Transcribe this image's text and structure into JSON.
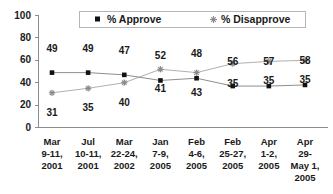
{
  "chart_data": {
    "type": "line",
    "title": "",
    "xlabel": "",
    "ylabel": "",
    "ylim": [
      0,
      100
    ],
    "yticks": [
      0,
      20,
      40,
      60,
      80,
      100
    ],
    "grid": false,
    "legend_position": "top-center",
    "categories": [
      "Mar 9-11, 2001",
      "Jul 10-11, 2001",
      "Mar 22-24, 2002",
      "Jan 7-9, 2005",
      "Feb 4-6, 2005",
      "Feb 25-27, 2005",
      "Apr 1-2, 2005",
      "Apr 29-May 1, 2005"
    ],
    "category_lines": [
      [
        "Mar",
        "9-11,",
        "2001"
      ],
      [
        "Jul",
        "10-11,",
        "2001"
      ],
      [
        "Mar",
        "22-24,",
        "2002"
      ],
      [
        "Jan",
        "7-9,",
        "2005"
      ],
      [
        "Feb",
        "4-6,",
        "2005"
      ],
      [
        "Feb",
        "25-27,",
        "2005"
      ],
      [
        "Apr",
        "1-2,",
        "2005"
      ],
      [
        "Apr",
        "29-",
        "May 1,",
        "2005"
      ]
    ],
    "series": [
      {
        "name": "% Approve",
        "marker": "square",
        "color": "#111111",
        "values": [
          49,
          49,
          47,
          42,
          44,
          37,
          37,
          38
        ],
        "labels": [
          49,
          49,
          47,
          52,
          48,
          56,
          57,
          58
        ],
        "label_position": "above"
      },
      {
        "name": "% Disapprove",
        "marker": "star",
        "color": "#8a8a8a",
        "values": [
          31,
          35,
          40,
          52,
          49,
          57,
          59,
          60
        ],
        "labels": [
          31,
          35,
          40,
          41,
          43,
          35,
          35,
          35
        ],
        "label_position": "below"
      }
    ]
  },
  "legend": {
    "items": [
      {
        "label": "% Approve",
        "marker": "square-marker"
      },
      {
        "label": "% Disapprove",
        "marker": "star-marker"
      }
    ]
  },
  "axis": {
    "y_tick_labels": [
      "100",
      "80",
      "60",
      "40",
      "20",
      "0"
    ]
  }
}
